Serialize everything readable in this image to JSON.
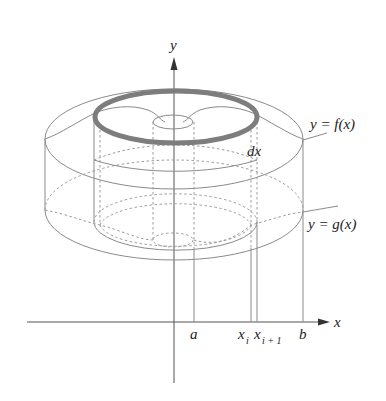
{
  "figure": {
    "type": "solid-of-revolution-shell-diagram",
    "labels": {
      "y_axis": "y",
      "x_axis": "x",
      "top_curve": "y = f(x)",
      "bottom_curve": "y = g(x)",
      "shell_width": "dx",
      "a": "a",
      "b": "b",
      "x_i": "x",
      "x_i_sub": "i",
      "x_i1": "x",
      "x_i1_sub": "i + 1"
    },
    "colors": {
      "line": "#8a8a8a",
      "axis": "#555555",
      "shell_ring": "#7d7d7d",
      "text": "#222222"
    }
  }
}
